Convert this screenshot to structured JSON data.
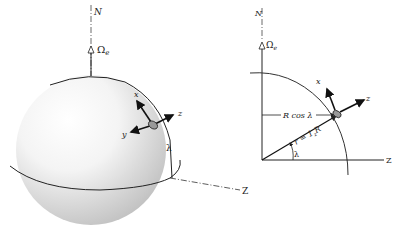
{
  "left_figure": {
    "north_label": "N",
    "omega_label": "Ω",
    "omega_sub": "e",
    "x_label": "x",
    "y_label": "y",
    "z_label": "z",
    "lambda_label": "λ",
    "Z_label": "Z"
  },
  "right_figure": {
    "north_label": "N",
    "omega_label": "Ω",
    "omega_sub": "e",
    "x_label": "x",
    "z_label": "z",
    "rcos_label": "R cos λ",
    "r_label": "r = 1",
    "r_sub": "z",
    "r_tail": "R",
    "lambda_label": "λ",
    "Z_label": "Z"
  }
}
